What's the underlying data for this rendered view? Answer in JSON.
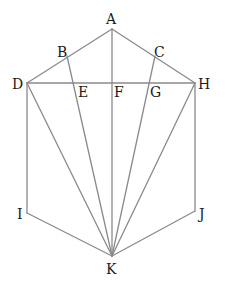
{
  "diagram": {
    "line_color": "#8a8a8a",
    "label_color": "#1a1a1a",
    "points": [
      {
        "id": "A",
        "label": "A"
      },
      {
        "id": "B",
        "label": "B"
      },
      {
        "id": "C",
        "label": "C"
      },
      {
        "id": "D",
        "label": "D"
      },
      {
        "id": "E",
        "label": "E"
      },
      {
        "id": "F",
        "label": "F"
      },
      {
        "id": "G",
        "label": "G"
      },
      {
        "id": "H",
        "label": "H"
      },
      {
        "id": "I",
        "label": "I"
      },
      {
        "id": "J",
        "label": "J"
      },
      {
        "id": "K",
        "label": "K"
      }
    ],
    "segments": [
      [
        "D",
        "A"
      ],
      [
        "A",
        "H"
      ],
      [
        "D",
        "H"
      ],
      [
        "D",
        "I"
      ],
      [
        "H",
        "J"
      ],
      [
        "I",
        "K"
      ],
      [
        "J",
        "K"
      ],
      [
        "D",
        "K"
      ],
      [
        "B",
        "K"
      ],
      [
        "A",
        "K"
      ],
      [
        "C",
        "K"
      ],
      [
        "H",
        "K"
      ]
    ]
  }
}
